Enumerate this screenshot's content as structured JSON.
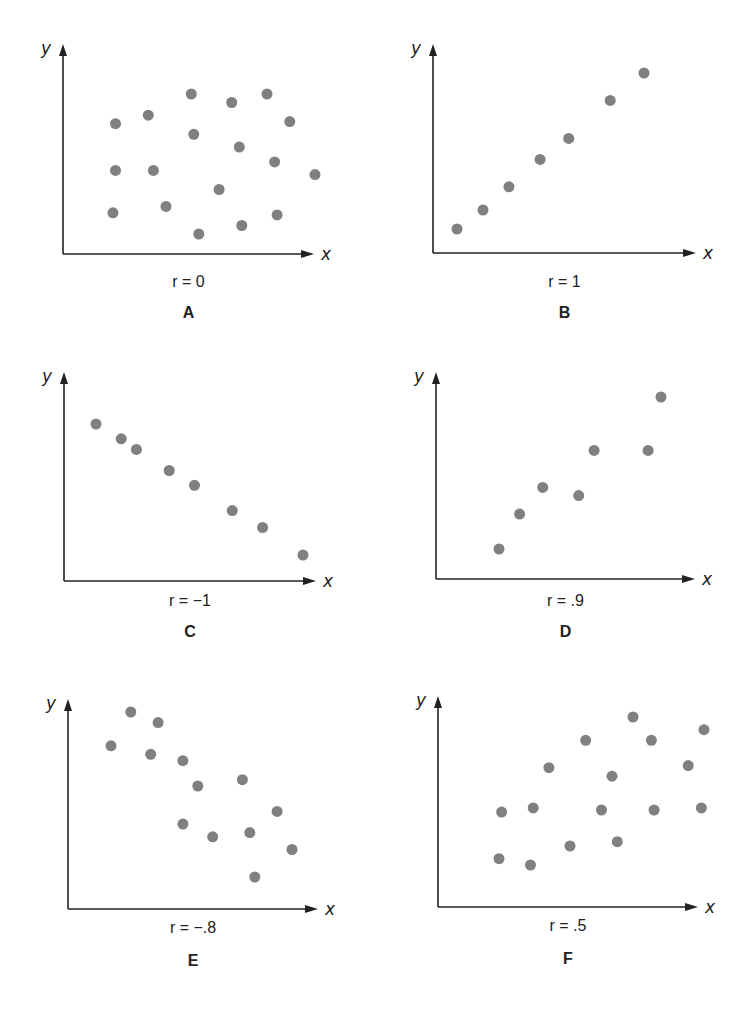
{
  "chart_data": [
    {
      "type": "scatter",
      "panel": "A",
      "title": "r = 0",
      "xlabel": "x",
      "ylabel": "y",
      "correlation": 0,
      "grid": false,
      "xlim": [
        0,
        100
      ],
      "ylim": [
        0,
        100
      ],
      "points": [
        [
          21,
          62
        ],
        [
          34,
          66
        ],
        [
          51,
          76
        ],
        [
          67,
          72
        ],
        [
          81,
          76
        ],
        [
          90,
          63
        ],
        [
          52,
          57
        ],
        [
          70,
          51
        ],
        [
          21,
          40
        ],
        [
          36,
          40
        ],
        [
          84,
          44
        ],
        [
          100,
          38
        ],
        [
          62,
          31
        ],
        [
          20,
          20
        ],
        [
          41,
          23
        ],
        [
          54,
          10
        ],
        [
          71,
          14
        ],
        [
          85,
          19
        ]
      ]
    },
    {
      "type": "scatter",
      "panel": "B",
      "title": "r = 1",
      "xlabel": "x",
      "ylabel": "y",
      "correlation": 1,
      "grid": false,
      "xlim": [
        0,
        100
      ],
      "ylim": [
        0,
        100
      ],
      "points": [
        [
          9,
          12
        ],
        [
          19,
          21
        ],
        [
          29,
          32
        ],
        [
          41,
          45
        ],
        [
          52,
          55
        ],
        [
          68,
          73
        ],
        [
          81,
          86
        ]
      ]
    },
    {
      "type": "scatter",
      "panel": "C",
      "title": "r = −1",
      "xlabel": "x",
      "ylabel": "y",
      "correlation": -1,
      "grid": false,
      "xlim": [
        0,
        100
      ],
      "ylim": [
        0,
        100
      ],
      "points": [
        [
          13,
          80
        ],
        [
          23,
          73
        ],
        [
          29,
          68
        ],
        [
          42,
          58
        ],
        [
          52,
          51
        ],
        [
          67,
          39
        ],
        [
          79,
          31
        ],
        [
          95,
          18
        ]
      ]
    },
    {
      "type": "scatter",
      "panel": "D",
      "title": "r = .9",
      "xlabel": "x",
      "ylabel": "y",
      "correlation": 0.9,
      "grid": false,
      "xlim": [
        0,
        100
      ],
      "ylim": [
        0,
        100
      ],
      "points": [
        [
          25,
          15
        ],
        [
          33,
          32
        ],
        [
          42,
          45
        ],
        [
          56,
          41
        ],
        [
          62,
          63
        ],
        [
          83,
          63
        ],
        [
          88,
          89
        ]
      ]
    },
    {
      "type": "scatter",
      "panel": "E",
      "title": "r = −.8",
      "xlabel": "x",
      "ylabel": "y",
      "correlation": -0.8,
      "grid": false,
      "xlim": [
        0,
        100
      ],
      "ylim": [
        0,
        100
      ],
      "points": [
        [
          25,
          93
        ],
        [
          36,
          88
        ],
        [
          17,
          77
        ],
        [
          33,
          73
        ],
        [
          46,
          70
        ],
        [
          52,
          58
        ],
        [
          70,
          61
        ],
        [
          84,
          46
        ],
        [
          46,
          40
        ],
        [
          58,
          34
        ],
        [
          73,
          36
        ],
        [
          90,
          28
        ],
        [
          75,
          15
        ]
      ]
    },
    {
      "type": "scatter",
      "panel": "F",
      "title": "r = .5",
      "xlabel": "x",
      "ylabel": "y",
      "correlation": 0.5,
      "grid": false,
      "xlim": [
        0,
        100
      ],
      "ylim": [
        0,
        100
      ],
      "points": [
        [
          75,
          90
        ],
        [
          102,
          84
        ],
        [
          57,
          79
        ],
        [
          82,
          79
        ],
        [
          43,
          66
        ],
        [
          96,
          67
        ],
        [
          67,
          62
        ],
        [
          25,
          45
        ],
        [
          37,
          47
        ],
        [
          63,
          46
        ],
        [
          83,
          46
        ],
        [
          101,
          47
        ],
        [
          51,
          29
        ],
        [
          69,
          31
        ],
        [
          24,
          23
        ],
        [
          36,
          20
        ]
      ]
    }
  ],
  "colors": {
    "dot": "#808080",
    "axis": "#222222"
  }
}
